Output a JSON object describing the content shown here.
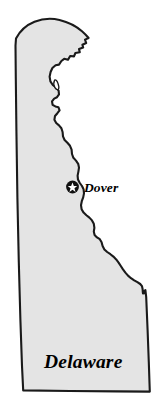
{
  "figure": {
    "title": "Delaware",
    "type": "state-outline-map",
    "width": 166,
    "height": 412,
    "background_color": "#ffffff"
  },
  "map": {
    "state_name": "Delaware",
    "state_label": "Delaware",
    "fill_color": "#e4e4e4",
    "outline_color": "#1a1a1a",
    "label_color": "#000000"
  },
  "capital_marker": {
    "city_label": "Dover",
    "icon": "star-in-circle-icon",
    "marker_fill": "#111111",
    "star_fill": "#ffffff",
    "x": 72.5,
    "y": 187
  },
  "labels": {
    "state": {
      "text": "Delaware",
      "x": 44,
      "y": 368
    },
    "capital": {
      "text": "Dover",
      "x": 84,
      "y": 192
    }
  }
}
